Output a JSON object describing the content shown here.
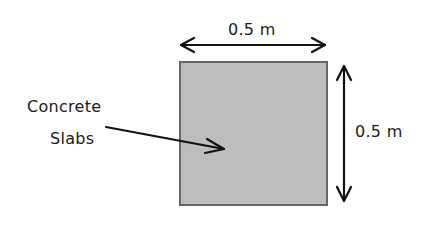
{
  "diagram": {
    "shape": "square",
    "fill_color": "#bdbdbd",
    "border_color": "#666666",
    "width_label": "0.5 m",
    "height_label": "0.5 m",
    "callout_label_line1": "Concrete",
    "callout_label_line2": "Slabs"
  }
}
